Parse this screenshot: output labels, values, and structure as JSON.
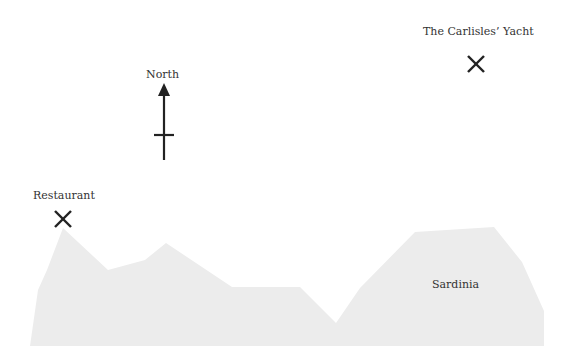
{
  "map": {
    "background_color": "#ffffff",
    "land": {
      "name": "Sardinia",
      "fill_color": "#ececec",
      "outline_points": [
        [
          30,
          346
        ],
        [
          38,
          290
        ],
        [
          47,
          270
        ],
        [
          63,
          228
        ],
        [
          108,
          270
        ],
        [
          145,
          260
        ],
        [
          166,
          243
        ],
        [
          232,
          287
        ],
        [
          300,
          287
        ],
        [
          336,
          323
        ],
        [
          360,
          288
        ],
        [
          415,
          232
        ],
        [
          494,
          227
        ],
        [
          522,
          262
        ],
        [
          544,
          311
        ],
        [
          544,
          346
        ]
      ]
    },
    "labels": {
      "yacht": "The Carlisles’ Yacht",
      "north": "North",
      "restaurant": "Restaurant",
      "land": "Sardinia"
    },
    "markers": [
      {
        "name": "yacht-marker",
        "symbol": "x",
        "x": 476,
        "y": 64
      },
      {
        "name": "restaurant-marker",
        "symbol": "x",
        "x": 63,
        "y": 219
      }
    ],
    "compass": {
      "label": "North",
      "x": 164,
      "tip_y": 83,
      "bottom_y": 160,
      "crossbar_y": 135,
      "crossbar_half_width": 10
    },
    "ink_color": "#222222"
  }
}
